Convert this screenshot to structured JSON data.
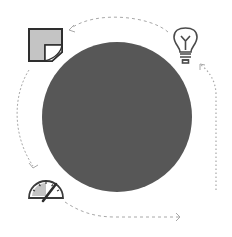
{
  "diagram": {
    "type": "cycle",
    "center_circle": {
      "color": "#575757",
      "cx": 117,
      "cy": 117,
      "r": 75
    },
    "icons": [
      {
        "name": "sticky-note-icon",
        "position": "top-left"
      },
      {
        "name": "lightbulb-icon",
        "position": "top-right"
      },
      {
        "name": "gauge-icon",
        "position": "bottom-left"
      }
    ],
    "connectors": [
      {
        "from": "lightbulb-icon",
        "to": "sticky-note-icon",
        "style": "dashed"
      },
      {
        "from": "sticky-note-icon",
        "to": "gauge-icon",
        "style": "dashed"
      },
      {
        "from": "gauge-icon",
        "to": "bottom-right",
        "style": "dashed"
      },
      {
        "from": "bottom-right",
        "to": "lightbulb-icon",
        "style": "dotted"
      }
    ],
    "colors": {
      "icon_stroke": "#3a3a3a",
      "icon_fill": "#c4c4c4",
      "connector": "#a8a8a8"
    }
  }
}
